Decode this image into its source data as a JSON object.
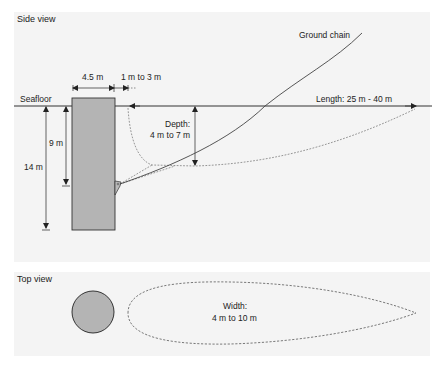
{
  "side_view": {
    "title": "Side view",
    "labels": {
      "seafloor": "Seafloor",
      "pile_width": "4.5 m",
      "gap": "1 m to 3 m",
      "ground_chain": "Ground chain",
      "length": "Length: 25 m - 40 m",
      "depth_line1": "Depth:",
      "depth_line2": "4 m to 7 m",
      "embed_9": "9 m",
      "embed_14": "14 m"
    }
  },
  "top_view": {
    "title": "Top view",
    "labels": {
      "width_line1": "Width:",
      "width_line2": "4 m to 10 m"
    }
  },
  "colors": {
    "panel_bg": "#f4f4f4",
    "pile_fill": "#b4b4b4",
    "line": "#333333",
    "chain": "#444444"
  }
}
